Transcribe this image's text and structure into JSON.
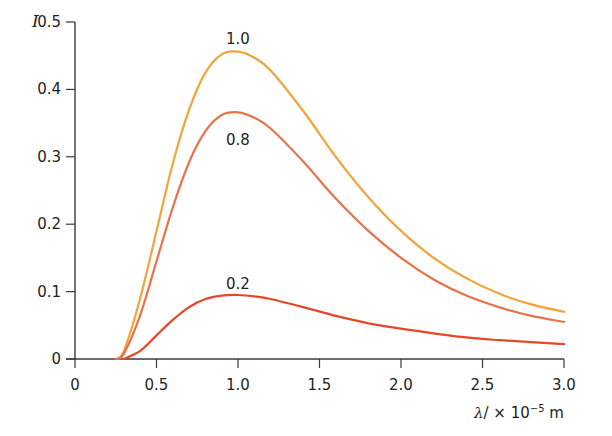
{
  "chart_data": {
    "type": "line",
    "title": "",
    "xlabel": "λ / × 10^-5 m",
    "ylabel": "I",
    "xlim": [
      0,
      3.0
    ],
    "ylim": [
      0,
      0.5
    ],
    "grid": false,
    "legend": "inline curve labels",
    "x_ticks": [
      "0",
      "0.5",
      "1.0",
      "1.5",
      "2.0",
      "2.5",
      "3.0"
    ],
    "y_ticks": [
      "0",
      "0.1",
      "0.2",
      "0.3",
      "0.4",
      "0.5"
    ],
    "x": [
      0.25,
      0.3,
      0.4,
      0.5,
      0.6,
      0.7,
      0.8,
      0.9,
      1.0,
      1.1,
      1.2,
      1.4,
      1.6,
      1.8,
      2.0,
      2.2,
      2.4,
      2.6,
      2.8,
      3.0
    ],
    "series": [
      {
        "name": "1.0",
        "color": "#F0A43A",
        "values": [
          0.0,
          0.012,
          0.09,
          0.19,
          0.29,
          0.37,
          0.425,
          0.452,
          0.456,
          0.447,
          0.428,
          0.368,
          0.3,
          0.24,
          0.19,
          0.15,
          0.12,
          0.097,
          0.081,
          0.07
        ]
      },
      {
        "name": "0.8",
        "color": "#E8734A",
        "values": [
          0.0,
          0.008,
          0.065,
          0.145,
          0.225,
          0.292,
          0.338,
          0.362,
          0.366,
          0.358,
          0.342,
          0.293,
          0.238,
          0.19,
          0.15,
          0.118,
          0.094,
          0.077,
          0.064,
          0.055
        ]
      },
      {
        "name": "0.2",
        "color": "#E4472A",
        "values": [
          null,
          0.0,
          0.012,
          0.035,
          0.058,
          0.077,
          0.089,
          0.094,
          0.095,
          0.093,
          0.089,
          0.077,
          0.064,
          0.053,
          0.045,
          0.038,
          0.032,
          0.028,
          0.025,
          0.022
        ]
      }
    ],
    "annotations": [
      {
        "text": "1.0",
        "x": 1.0,
        "y": 0.475
      },
      {
        "text": "0.8",
        "x": 1.0,
        "y": 0.325
      },
      {
        "text": "0.2",
        "x": 1.0,
        "y": 0.112
      }
    ]
  },
  "labels": {
    "y_axis": "I",
    "x_axis_symbol": "λ",
    "x_axis_rest": "/ × 10",
    "x_axis_exp": "−5",
    "x_axis_unit": " m"
  }
}
